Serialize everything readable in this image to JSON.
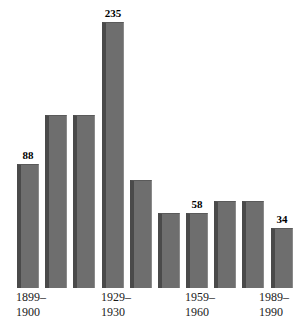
{
  "chart_data": {
    "type": "bar",
    "title": "",
    "subtitle": "",
    "xlabel": "",
    "ylabel": "",
    "grid": false,
    "legend": "none",
    "ylim": [
      0,
      235
    ],
    "orientation": "vertical",
    "bar_color": "#6e6e6e",
    "bar_edge_color": "#4a4a4a",
    "background_color": "#ffffff",
    "label_color": "#000000",
    "categories": [
      "1899-1900",
      "1909-1910",
      "1919-1920",
      "1929-1930",
      "1939-1940",
      "1949-1950",
      "1959-1960",
      "1969-1970",
      "1979-1980",
      "1989-1990"
    ],
    "values": [
      88,
      123,
      123,
      235,
      77,
      53,
      58,
      62,
      62,
      34
    ],
    "data_labels": [
      "88",
      "",
      "",
      "235",
      "",
      "",
      "58",
      "",
      "",
      "34"
    ],
    "tick_labels": [
      {
        "index": 0,
        "line1": "1899–",
        "line2": "1900"
      },
      {
        "index": 3,
        "line1": "1929–",
        "line2": "1930"
      },
      {
        "index": 6,
        "line1": "1959–",
        "line2": "1960"
      },
      {
        "index": 9,
        "line1": "1989–",
        "line2": "1990"
      }
    ],
    "annotations": []
  },
  "bars": [
    {
      "name": "bar-1899-1900",
      "value_label": "88",
      "left": 17,
      "width": 22,
      "height": 124,
      "show_label": true
    },
    {
      "name": "bar-1909-1910",
      "value_label": "",
      "left": 45,
      "width": 22,
      "height": 173,
      "show_label": false
    },
    {
      "name": "bar-1919-1920",
      "value_label": "",
      "left": 73,
      "width": 22,
      "height": 173,
      "show_label": false
    },
    {
      "name": "bar-1929-1930",
      "value_label": "235",
      "left": 102,
      "width": 22,
      "height": 266,
      "show_label": true
    },
    {
      "name": "bar-1939-1940",
      "value_label": "",
      "left": 130,
      "width": 22,
      "height": 108,
      "show_label": false
    },
    {
      "name": "bar-1949-1950",
      "value_label": "",
      "left": 158,
      "width": 22,
      "height": 75,
      "show_label": false
    },
    {
      "name": "bar-1959-1960",
      "value_label": "58",
      "left": 186,
      "width": 22,
      "height": 75,
      "show_label": true
    },
    {
      "name": "bar-1969-1970",
      "value_label": "",
      "left": 214,
      "width": 22,
      "height": 87,
      "show_label": false
    },
    {
      "name": "bar-1979-1980",
      "value_label": "",
      "left": 242,
      "width": 22,
      "height": 87,
      "show_label": false
    },
    {
      "name": "bar-1989-1990",
      "value_label": "34",
      "left": 271,
      "width": 22,
      "height": 60,
      "show_label": true
    }
  ],
  "axis_labels": [
    {
      "name": "axis-label-1899-1900",
      "left": 16,
      "line1": "1899–",
      "line2": "1900"
    },
    {
      "name": "axis-label-1929-1930",
      "left": 101,
      "line1": "1929–",
      "line2": "1930"
    },
    {
      "name": "axis-label-1959-1960",
      "left": 185,
      "line1": "1959–",
      "line2": "1960"
    },
    {
      "name": "axis-label-1989-1990",
      "left": 259,
      "line1": "1989–",
      "line2": "1990"
    }
  ]
}
